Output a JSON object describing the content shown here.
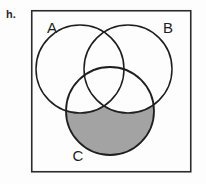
{
  "figure": {
    "item_label": "h.",
    "background_color": "#fdfdfd",
    "border_color": "#2b2b2b",
    "stroke_color": "#1f1f1f",
    "shade_color": "#a3a3a3",
    "frame": {
      "x": 31,
      "y": 10,
      "width": 160,
      "height": 162
    },
    "sets": [
      {
        "id": "A",
        "label": "A",
        "cx": 80,
        "cy": 69,
        "r": 44,
        "label_x": 52,
        "label_y": 33
      },
      {
        "id": "B",
        "label": "B",
        "cx": 128,
        "cy": 69,
        "r": 44,
        "label_x": 162,
        "label_y": 33
      },
      {
        "id": "C",
        "label": "C",
        "cx": 110,
        "cy": 111,
        "r": 44,
        "label_x": 72,
        "label_y": 161
      }
    ],
    "shaded_region": {
      "name": "C-only",
      "description": "C minus (A union B)",
      "fill": "#a3a3a3"
    }
  }
}
